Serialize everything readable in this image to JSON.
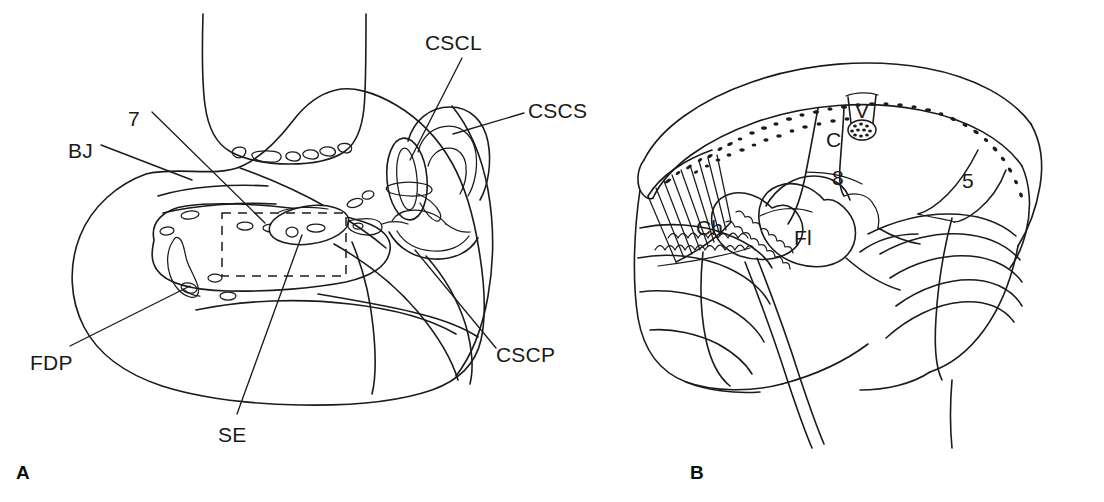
{
  "figure": {
    "type": "anatomical-line-drawing",
    "background_color": "#ffffff",
    "ink_color": "#1b1b1b",
    "width": 1104,
    "height": 502,
    "panel_count": 2
  },
  "panel_a": {
    "letter": "A",
    "letter_x": 16,
    "letter_y": 463,
    "description": "Lateral view line drawing of temporal bone region showing semicircular canals, facial nerve and related structures",
    "labels": [
      {
        "id": "cscl",
        "text": "CSCL",
        "x": 425,
        "y": 32,
        "meaning": "lateral semicircular canal"
      },
      {
        "id": "cscs",
        "text": "CSCS",
        "x": 528,
        "y": 100,
        "meaning": "superior semicircular canal"
      },
      {
        "id": "seven",
        "text": "7",
        "x": 128,
        "y": 108,
        "meaning": "facial nerve (cranial nerve VII)"
      },
      {
        "id": "bj",
        "text": "BJ",
        "x": 68,
        "y": 140,
        "meaning": "jugular bulb"
      },
      {
        "id": "cscp",
        "text": "CSCP",
        "x": 496,
        "y": 344,
        "meaning": "posterior semicircular canal"
      },
      {
        "id": "fdp",
        "text": "FDP",
        "x": 30,
        "y": 352,
        "meaning": "posterior fossa dura"
      },
      {
        "id": "se",
        "text": "SE",
        "x": 218,
        "y": 424,
        "meaning": "endolymphatic sac"
      }
    ]
  },
  "panel_b": {
    "letter": "B",
    "letter_x": 690,
    "letter_y": 463,
    "description": "Intracranial view line drawing of cerebellopontine angle with cranial nerves, flocculus and choroid plexus",
    "labels": [
      {
        "id": "v",
        "text": "V",
        "x": 858,
        "y": 100,
        "meaning": "trigeminal nerve (cranial nerve V)"
      },
      {
        "id": "c",
        "text": "C",
        "x": 829,
        "y": 130,
        "meaning": "cochlear nerve"
      },
      {
        "id": "eight",
        "text": "8",
        "x": 833,
        "y": 168,
        "meaning": "vestibulocochlear nerve (cranial nerve VIII)"
      },
      {
        "id": "five",
        "text": "5",
        "x": 963,
        "y": 171,
        "meaning": "cranial nerve V root"
      },
      {
        "id": "ch",
        "text": "Ch",
        "x": 697,
        "y": 218,
        "meaning": "choroid plexus"
      },
      {
        "id": "fl",
        "text": "Fl",
        "x": 795,
        "y": 228,
        "meaning": "flocculus"
      }
    ]
  }
}
